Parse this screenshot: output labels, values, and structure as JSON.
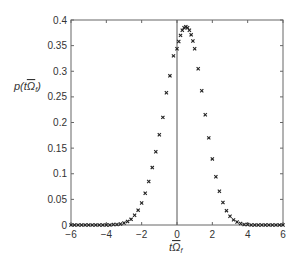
{
  "chart_data": {
    "type": "scatter",
    "title": "",
    "xlabel": "tΩ̅_f",
    "xlabel_parts": {
      "t": "t",
      "omega": "Ω",
      "sub": "f"
    },
    "ylabel": "p(tΩ̅_f)",
    "ylabel_parts": {
      "p": "p(",
      "t": "t",
      "omega": "Ω",
      "sub": "f",
      "close": ")"
    },
    "xlim": [
      -6,
      6
    ],
    "ylim": [
      0,
      0.4
    ],
    "x_ticks": [
      -6,
      -4,
      -2,
      0,
      2,
      4,
      6
    ],
    "x_tick_labels": [
      "−6",
      "−4",
      "−2",
      "0",
      "2",
      "4",
      "6"
    ],
    "y_ticks": [
      0,
      0.05,
      0.1,
      0.15,
      0.2,
      0.25,
      0.3,
      0.35,
      0.4
    ],
    "y_tick_labels": [
      "0",
      "0.05",
      "0.1",
      "0.15",
      "0.2",
      "0.25",
      "0.3",
      "0.35",
      "0.4"
    ],
    "grid": false,
    "legend": null,
    "vertical_reference_line_x": 0,
    "marker": "x",
    "marker_color": "#222222",
    "series": [
      {
        "name": "p(tΩ_f)",
        "description": "Gaussian-shaped distribution, peak ~0.387 near x~0.5, sigma ~1.03",
        "x": [
          -6.0,
          -5.8,
          -5.6,
          -5.4,
          -5.2,
          -5.0,
          -4.8,
          -4.6,
          -4.4,
          -4.2,
          -4.0,
          -3.8,
          -3.6,
          -3.4,
          -3.2,
          -3.0,
          -2.8,
          -2.6,
          -2.4,
          -2.2,
          -2.0,
          -1.8,
          -1.6,
          -1.4,
          -1.2,
          -1.0,
          -0.8,
          -0.6,
          -0.4,
          -0.2,
          0.0,
          0.1,
          0.2,
          0.3,
          0.4,
          0.5,
          0.6,
          0.7,
          0.8,
          0.9,
          1.0,
          1.2,
          1.4,
          1.6,
          1.8,
          2.0,
          2.2,
          2.4,
          2.6,
          2.8,
          3.0,
          3.2,
          3.4,
          3.6,
          3.8,
          4.0,
          4.2,
          4.4,
          4.6,
          4.8,
          5.0,
          5.2,
          5.4,
          5.6,
          5.8,
          6.0
        ],
        "y": [
          0.0,
          0.0,
          0.0,
          0.0,
          0.0,
          0.0,
          0.0,
          0.0,
          0.0,
          0.0,
          0.0,
          0.0,
          0.001,
          0.001,
          0.002,
          0.004,
          0.007,
          0.011,
          0.019,
          0.029,
          0.043,
          0.062,
          0.085,
          0.112,
          0.143,
          0.176,
          0.21,
          0.258,
          0.291,
          0.33,
          0.344,
          0.358,
          0.37,
          0.38,
          0.385,
          0.387,
          0.385,
          0.38,
          0.371,
          0.359,
          0.344,
          0.305,
          0.262,
          0.215,
          0.17,
          0.129,
          0.094,
          0.066,
          0.044,
          0.028,
          0.017,
          0.01,
          0.006,
          0.003,
          0.001,
          0.001,
          0.0,
          0.0,
          0.0,
          0.0,
          0.0,
          0.0,
          0.0,
          0.0,
          0.0,
          0.0
        ]
      }
    ]
  },
  "colors": {
    "axis": "#555555",
    "marker": "#222222",
    "background": "#ffffff",
    "text": "#333333"
  }
}
